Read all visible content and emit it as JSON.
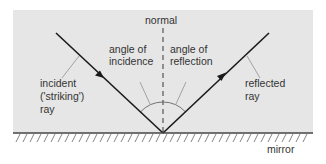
{
  "diagram": {
    "labels": {
      "normal": "normal",
      "angle_of_incidence_line1": "angle of",
      "angle_of_incidence_line2": "incidence",
      "angle_of_reflection_line1": "angle of",
      "angle_of_reflection_line2": "reflection",
      "incident_line1": "incident",
      "incident_line2": "('striking')",
      "incident_line3": "ray",
      "reflected_line1": "reflected",
      "reflected_line2": "ray",
      "mirror": "mirror"
    },
    "colors": {
      "panel": "#e6e6e6",
      "ray": "#1a1a1a",
      "normal": "#555555",
      "leader": "#9a9a9a",
      "mirror": "#444444",
      "hatch": "#777777"
    }
  }
}
